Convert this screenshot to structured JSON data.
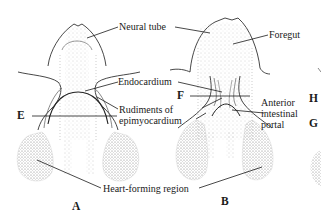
{
  "figure": {
    "panels": [
      {
        "id": "A",
        "label": "A"
      },
      {
        "id": "B",
        "label": "B"
      }
    ],
    "section_markers": [
      "E",
      "F",
      "G",
      "H"
    ],
    "labels": {
      "neural_tube": "Neural tube",
      "foregut": "Foregut",
      "endocardium": "Endocardium",
      "rudiments_line1": "Rudiments of",
      "rudiments_line2": "epimyocardium",
      "anterior_line1": "Anterior",
      "anterior_line2": "intestinal",
      "anterior_line3": "portal",
      "heart_forming_region": "Heart-forming region"
    },
    "colors": {
      "ink": "#1a1a1a",
      "stipple": "#8a8a8a",
      "background": "#ffffff"
    }
  }
}
